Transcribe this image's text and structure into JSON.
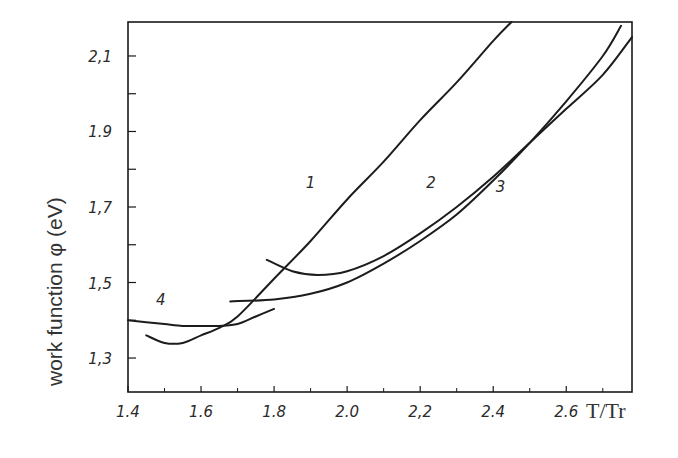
{
  "chart_data": {
    "type": "line",
    "title": "",
    "xlabel": "T/Tr",
    "ylabel": "work function φ (eV)",
    "xlim": [
      1.4,
      2.78
    ],
    "ylim": [
      1.21,
      2.19
    ],
    "grid": false,
    "legend": "none (curves labeled inline 1–4)",
    "x_ticks": [
      1.4,
      1.6,
      1.8,
      2.0,
      2.2,
      2.4,
      2.6
    ],
    "x_tick_labels": [
      "1.4",
      "1.6",
      "1.8",
      "2.0",
      "2,2",
      "2.4",
      "2.6"
    ],
    "y_ticks": [
      1.3,
      1.5,
      1.7,
      1.9,
      2.1
    ],
    "y_tick_labels": [
      "1,3",
      "1,5",
      "1,7",
      "1.9",
      "2,1"
    ],
    "series": [
      {
        "name": "1",
        "x": [
          1.45,
          1.5,
          1.55,
          1.6,
          1.65,
          1.7,
          1.8,
          1.9,
          2.0,
          2.1,
          2.2,
          2.3,
          2.4,
          2.45
        ],
        "y": [
          1.36,
          1.34,
          1.34,
          1.36,
          1.38,
          1.41,
          1.51,
          1.61,
          1.72,
          1.82,
          1.93,
          2.03,
          2.14,
          2.19
        ]
      },
      {
        "name": "2",
        "x": [
          1.78,
          1.85,
          1.92,
          2.0,
          2.1,
          2.2,
          2.3,
          2.4,
          2.5,
          2.6,
          2.7,
          2.78
        ],
        "y": [
          1.56,
          1.53,
          1.52,
          1.53,
          1.57,
          1.63,
          1.7,
          1.78,
          1.87,
          1.96,
          2.05,
          2.15
        ]
      },
      {
        "name": "3",
        "x": [
          1.68,
          1.8,
          1.9,
          2.0,
          2.1,
          2.2,
          2.3,
          2.4,
          2.5,
          2.6,
          2.7,
          2.75
        ],
        "y": [
          1.45,
          1.455,
          1.47,
          1.5,
          1.55,
          1.61,
          1.68,
          1.77,
          1.87,
          1.98,
          2.1,
          2.18
        ]
      },
      {
        "name": "4",
        "x": [
          1.4,
          1.45,
          1.5,
          1.55,
          1.6,
          1.65,
          1.7,
          1.75,
          1.8
        ],
        "y": [
          1.4,
          1.395,
          1.39,
          1.385,
          1.385,
          1.385,
          1.39,
          1.41,
          1.43
        ]
      }
    ],
    "annotations": [
      {
        "text": "1",
        "x": 1.9,
        "y": 1.75
      },
      {
        "text": "2",
        "x": 2.23,
        "y": 1.75
      },
      {
        "text": "3",
        "x": 2.42,
        "y": 1.74
      },
      {
        "text": "4",
        "x": 1.49,
        "y": 1.44
      }
    ]
  },
  "axes": {
    "xlabel": "T/Tr",
    "ylabel": "work function φ (eV)"
  },
  "labels": {
    "curve_1": "1",
    "curve_2": "2",
    "curve_3": "3",
    "curve_4": "4"
  }
}
